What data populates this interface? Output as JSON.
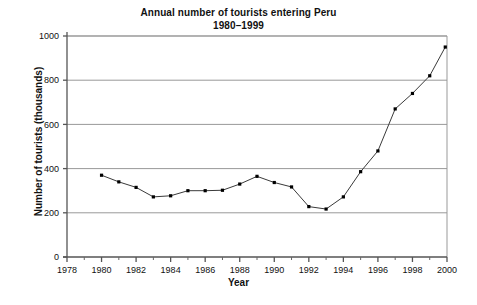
{
  "chart_data": {
    "type": "line",
    "title": "Annual number of tourists entering Peru",
    "subtitle": "1980–1999",
    "xlabel": "Year",
    "ylabel": "Number of tourists (thousands)",
    "xlim": [
      1978,
      2000
    ],
    "ylim": [
      0,
      1000
    ],
    "xticks": [
      1978,
      1980,
      1982,
      1984,
      1986,
      1988,
      1990,
      1992,
      1994,
      1996,
      1998,
      2000
    ],
    "xtick_labels": [
      "1978",
      "1980",
      "1982",
      "1984",
      "1986",
      "1988",
      "1990",
      "1992",
      "1994",
      "1996",
      "1998",
      "2000"
    ],
    "x_minor_ticks": [
      1979,
      1981,
      1983,
      1985,
      1987,
      1989,
      1991,
      1993,
      1995,
      1997,
      1999
    ],
    "yticks": [
      0,
      200,
      400,
      600,
      800,
      1000
    ],
    "ytick_labels": [
      "0",
      "200",
      "400",
      "600",
      "800",
      "1000"
    ],
    "grid": "horizontal",
    "legend": "none",
    "marker": "filled-square",
    "line_color": "#3a3a3a",
    "marker_color": "#000000",
    "grid_color": "#999999",
    "axis_color": "#666666",
    "x": [
      1980,
      1981,
      1982,
      1983,
      1984,
      1985,
      1986,
      1987,
      1988,
      1989,
      1990,
      1991,
      1992,
      1993,
      1994,
      1995,
      1996,
      1997,
      1998,
      1999
    ],
    "values": [
      370,
      340,
      315,
      272,
      277,
      300,
      300,
      302,
      330,
      365,
      337,
      317,
      228,
      217,
      272,
      386,
      480,
      670,
      740,
      820
    ],
    "series": [
      {
        "name": "Annual number of tourists entering Peru",
        "points": [
          {
            "year": 1980,
            "value": 370
          },
          {
            "year": 1981,
            "value": 340
          },
          {
            "year": 1982,
            "value": 315
          },
          {
            "year": 1983,
            "value": 272
          },
          {
            "year": 1984,
            "value": 277
          },
          {
            "year": 1985,
            "value": 300
          },
          {
            "year": 1986,
            "value": 300
          },
          {
            "year": 1987,
            "value": 302
          },
          {
            "year": 1988,
            "value": 330
          },
          {
            "year": 1989,
            "value": 365
          },
          {
            "year": 1990,
            "value": 337
          },
          {
            "year": 1991,
            "value": 317
          },
          {
            "year": 1992,
            "value": 228
          },
          {
            "year": 1993,
            "value": 217
          },
          {
            "year": 1994,
            "value": 272
          },
          {
            "year": 1995,
            "value": 386
          },
          {
            "year": 1996,
            "value": 480
          },
          {
            "year": 1997,
            "value": 670
          },
          {
            "year": 1998,
            "value": 740
          },
          {
            "year": 1999,
            "value": 820
          },
          {
            "year": 1999.9,
            "value": 950
          }
        ]
      }
    ]
  }
}
